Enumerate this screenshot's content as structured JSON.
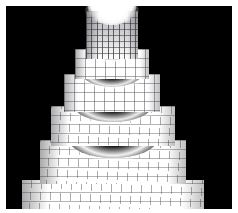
{
  "figure": {
    "title": "",
    "background_color": "#FFFFFF",
    "axes_background_color": "#000000",
    "border_color": "#FFFFFF",
    "width_px": 238,
    "height_px": 213,
    "axes_rect_px": {
      "x": 6,
      "y": 6,
      "width": 226,
      "height": 203
    },
    "axis_visible": false,
    "tick_labels_visible": false,
    "grid_visible": false,
    "colormap": "gray",
    "shading": "faceted",
    "bar_face_color": "#FFFFFF",
    "bar_edge_color": "#5A5A5F",
    "shadow_color": "#B9B9BD"
  },
  "chart_data": {
    "type": "bar",
    "render_style": "bar3-stepped-surface",
    "title": "",
    "subtitle": "",
    "xlabel": "",
    "ylabel": "",
    "zlabel": "",
    "xlim": [
      0,
      24
    ],
    "ylim": [
      0,
      24
    ],
    "zlim": [
      0,
      6
    ],
    "grid": false,
    "legend": null,
    "legend_position": "none",
    "categories": [
      "tier-1",
      "tier-2",
      "tier-3",
      "tier-4",
      "tier-5",
      "tier-6"
    ],
    "values": [
      6,
      5,
      4,
      3,
      2,
      1
    ],
    "series": [
      {
        "name": "bar_height_level",
        "values": [
          6,
          5,
          4,
          3,
          2,
          1
        ]
      },
      {
        "name": "tier_radius_cells",
        "values": [
          3,
          5,
          7,
          9,
          11,
          13
        ]
      }
    ],
    "tiers": [
      {
        "id": "tier-1",
        "level": 6,
        "label": "summit column",
        "x_px": 86,
        "y_px": 11,
        "width_px": 52,
        "height_px": 46,
        "columns": 9,
        "rows": 7,
        "has_bowl": true,
        "bowl_depth": 1,
        "shaded": true
      },
      {
        "id": "tier-2",
        "level": 5,
        "label": "terrace 5",
        "x_px": 75,
        "y_px": 49,
        "width_px": 74,
        "height_px": 31,
        "columns": 11,
        "rows": 4,
        "has_bowl": true,
        "bowl_depth": 1,
        "shaded": false
      },
      {
        "id": "tier-3",
        "level": 4,
        "label": "terrace 4",
        "x_px": 64,
        "y_px": 74,
        "width_px": 96,
        "height_px": 36,
        "columns": 13,
        "rows": 4,
        "has_bowl": true,
        "bowl_depth": 1,
        "shaded": false
      },
      {
        "id": "tier-4",
        "level": 3,
        "label": "terrace 3",
        "x_px": 51,
        "y_px": 106,
        "width_px": 124,
        "height_px": 38,
        "columns": 15,
        "rows": 4,
        "has_bowl": true,
        "bowl_depth": 1,
        "shaded": false
      },
      {
        "id": "tier-5",
        "level": 2,
        "label": "terrace 2",
        "x_px": 40,
        "y_px": 140,
        "width_px": 146,
        "height_px": 38,
        "columns": 17,
        "rows": 4,
        "has_bowl": true,
        "bowl_depth": 1,
        "shaded": false
      },
      {
        "id": "tier-6",
        "level": 1,
        "label": "base terrace",
        "x_px": 22,
        "y_px": 174,
        "width_px": 182,
        "height_px": 30,
        "columns": 19,
        "rows": 3,
        "has_bowl": false,
        "bowl_depth": 0,
        "shaded": false
      }
    ],
    "annotations": []
  }
}
